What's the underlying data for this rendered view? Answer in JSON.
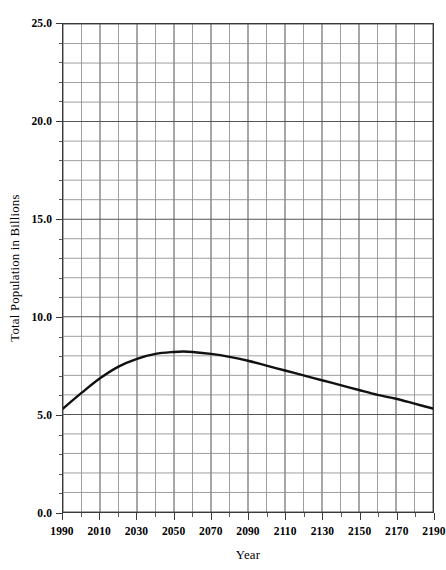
{
  "chart_data": {
    "type": "line",
    "title": "",
    "xlabel": "Year",
    "ylabel": "Total Population in Billions",
    "xlim": [
      1990,
      2190
    ],
    "ylim": [
      0.0,
      25.0
    ],
    "grid": true,
    "legend": "none",
    "x_major_step": 20,
    "x_minor_step": 10,
    "y_major_step": 5.0,
    "y_minor_step": 1.0,
    "x_tick_labels": [
      "1990",
      "2010",
      "2030",
      "2050",
      "2070",
      "2090",
      "2110",
      "2130",
      "2150",
      "2170",
      "2190"
    ],
    "y_tick_labels": [
      "0.0",
      "5.0",
      "10.0",
      "15.0",
      "20.0",
      "25.0"
    ],
    "line_color": "#111111",
    "line_width": 2.4,
    "series": [
      {
        "name": "Total Population",
        "x": [
          1990,
          2000,
          2010,
          2020,
          2030,
          2040,
          2050,
          2055,
          2060,
          2070,
          2080,
          2090,
          2100,
          2110,
          2120,
          2130,
          2140,
          2150,
          2160,
          2170,
          2180,
          2190
        ],
        "values": [
          5.3,
          6.1,
          6.85,
          7.45,
          7.85,
          8.1,
          8.2,
          8.22,
          8.2,
          8.1,
          7.95,
          7.75,
          7.5,
          7.25,
          7.0,
          6.75,
          6.5,
          6.25,
          6.0,
          5.8,
          5.55,
          5.3
        ]
      }
    ],
    "annotations": {
      "peak_year": 2055,
      "peak_value": 8.2,
      "start_value": 5.3,
      "end_value": 5.3
    }
  },
  "axes": {
    "y_title": "Total Population in Billions",
    "x_title": "Year"
  }
}
